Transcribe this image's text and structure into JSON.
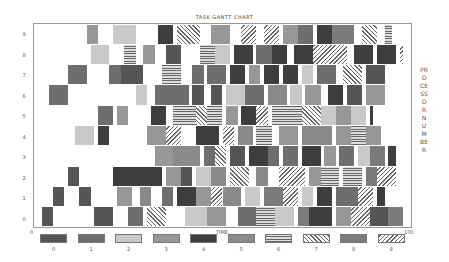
{
  "chart_data": {
    "type": "gantt",
    "title": "TASK GANTT CHART",
    "xlabel": "TIME",
    "ylabel": "PROCESSOR NUMBER",
    "xlim": [
      0,
      100
    ],
    "x_tick_labels": [
      "0",
      "100"
    ],
    "y_tick_labels": [
      "0",
      "1",
      "2",
      "3",
      "4",
      "5",
      "6",
      "7",
      "8",
      "9"
    ],
    "grid": false,
    "legend_position": "bottom",
    "legend": [
      "0",
      "1",
      "2",
      "3",
      "4",
      "5",
      "6",
      "7",
      "8",
      "9"
    ],
    "processors": [
      {
        "id": 0,
        "tasks": [
          {
            "start": 2,
            "end": 5,
            "type": 0
          },
          {
            "start": 16,
            "end": 21,
            "type": 0
          },
          {
            "start": 25,
            "end": 29,
            "type": 1
          },
          {
            "start": 30,
            "end": 35,
            "type": 7
          },
          {
            "start": 40,
            "end": 46,
            "type": 2
          },
          {
            "start": 46,
            "end": 51,
            "type": 3
          },
          {
            "start": 54,
            "end": 59,
            "type": 1
          },
          {
            "start": 59,
            "end": 64,
            "type": 6
          },
          {
            "start": 64,
            "end": 69,
            "type": 2
          },
          {
            "start": 70,
            "end": 73,
            "type": 8
          },
          {
            "start": 73,
            "end": 79,
            "type": 4
          },
          {
            "start": 80,
            "end": 84,
            "type": 3
          },
          {
            "start": 84,
            "end": 89,
            "type": 9
          },
          {
            "start": 89,
            "end": 94,
            "type": 0
          },
          {
            "start": 94,
            "end": 98,
            "type": 8
          }
        ]
      },
      {
        "id": 1,
        "tasks": [
          {
            "start": 5,
            "end": 8,
            "type": 0
          },
          {
            "start": 12,
            "end": 15,
            "type": 0
          },
          {
            "start": 22,
            "end": 26,
            "type": 3
          },
          {
            "start": 28,
            "end": 31,
            "type": 5
          },
          {
            "start": 34,
            "end": 37,
            "type": 1
          },
          {
            "start": 38,
            "end": 43,
            "type": 4
          },
          {
            "start": 43,
            "end": 47,
            "type": 3
          },
          {
            "start": 47,
            "end": 50,
            "type": 9
          },
          {
            "start": 50,
            "end": 55,
            "type": 5
          },
          {
            "start": 56,
            "end": 60,
            "type": 2
          },
          {
            "start": 61,
            "end": 66,
            "type": 8
          },
          {
            "start": 66,
            "end": 70,
            "type": 9
          },
          {
            "start": 71,
            "end": 74,
            "type": 2
          },
          {
            "start": 75,
            "end": 79,
            "type": 4
          },
          {
            "start": 80,
            "end": 86,
            "type": 1
          },
          {
            "start": 86,
            "end": 90,
            "type": 9
          },
          {
            "start": 91,
            "end": 93,
            "type": 4
          }
        ]
      },
      {
        "id": 2,
        "tasks": [
          {
            "start": 9,
            "end": 12,
            "type": 0
          },
          {
            "start": 21,
            "end": 34,
            "type": 4
          },
          {
            "start": 35,
            "end": 39,
            "type": 3
          },
          {
            "start": 39,
            "end": 42,
            "type": 0
          },
          {
            "start": 43,
            "end": 47,
            "type": 2
          },
          {
            "start": 47,
            "end": 51,
            "type": 5
          },
          {
            "start": 52,
            "end": 57,
            "type": 7
          },
          {
            "start": 59,
            "end": 62,
            "type": 5
          },
          {
            "start": 65,
            "end": 72,
            "type": 9
          },
          {
            "start": 73,
            "end": 76,
            "type": 3
          },
          {
            "start": 76,
            "end": 81,
            "type": 6
          },
          {
            "start": 82,
            "end": 87,
            "type": 6
          },
          {
            "start": 88,
            "end": 91,
            "type": 8
          },
          {
            "start": 91,
            "end": 96,
            "type": 9
          }
        ]
      },
      {
        "id": 3,
        "tasks": [
          {
            "start": 32,
            "end": 37,
            "type": 3
          },
          {
            "start": 37,
            "end": 40,
            "type": 5
          },
          {
            "start": 40,
            "end": 44,
            "type": 5
          },
          {
            "start": 45,
            "end": 48,
            "type": 1
          },
          {
            "start": 48,
            "end": 51,
            "type": 7
          },
          {
            "start": 52,
            "end": 56,
            "type": 0
          },
          {
            "start": 57,
            "end": 62,
            "type": 4
          },
          {
            "start": 62,
            "end": 65,
            "type": 1
          },
          {
            "start": 66,
            "end": 70,
            "type": 1
          },
          {
            "start": 71,
            "end": 76,
            "type": 4
          },
          {
            "start": 77,
            "end": 80,
            "type": 3
          },
          {
            "start": 81,
            "end": 85,
            "type": 1
          },
          {
            "start": 86,
            "end": 89,
            "type": 2
          },
          {
            "start": 89,
            "end": 93,
            "type": 8
          },
          {
            "start": 94,
            "end": 96,
            "type": 4
          }
        ]
      },
      {
        "id": 4,
        "tasks": [
          {
            "start": 11,
            "end": 16,
            "type": 2
          },
          {
            "start": 17,
            "end": 20,
            "type": 4
          },
          {
            "start": 30,
            "end": 35,
            "type": 3
          },
          {
            "start": 35,
            "end": 39,
            "type": 9
          },
          {
            "start": 43,
            "end": 49,
            "type": 4
          },
          {
            "start": 50,
            "end": 53,
            "type": 9
          },
          {
            "start": 54,
            "end": 58,
            "type": 5
          },
          {
            "start": 59,
            "end": 63,
            "type": 6
          },
          {
            "start": 65,
            "end": 70,
            "type": 3
          },
          {
            "start": 71,
            "end": 75,
            "type": 5
          },
          {
            "start": 75,
            "end": 79,
            "type": 5
          },
          {
            "start": 80,
            "end": 84,
            "type": 3
          },
          {
            "start": 84,
            "end": 88,
            "type": 6
          },
          {
            "start": 88,
            "end": 92,
            "type": 3
          }
        ]
      },
      {
        "id": 5,
        "tasks": [
          {
            "start": 17,
            "end": 21,
            "type": 1
          },
          {
            "start": 22,
            "end": 25,
            "type": 3
          },
          {
            "start": 31,
            "end": 35,
            "type": 4
          },
          {
            "start": 37,
            "end": 43,
            "type": 6
          },
          {
            "start": 43,
            "end": 46,
            "type": 7
          },
          {
            "start": 46,
            "end": 50,
            "type": 6
          },
          {
            "start": 51,
            "end": 54,
            "type": 3
          },
          {
            "start": 55,
            "end": 59,
            "type": 4
          },
          {
            "start": 59,
            "end": 62,
            "type": 9
          },
          {
            "start": 63,
            "end": 67,
            "type": 6
          },
          {
            "start": 67,
            "end": 71,
            "type": 6
          },
          {
            "start": 71,
            "end": 76,
            "type": 7
          },
          {
            "start": 76,
            "end": 80,
            "type": 2
          },
          {
            "start": 80,
            "end": 84,
            "type": 3
          },
          {
            "start": 84,
            "end": 88,
            "type": 2
          },
          {
            "start": 89,
            "end": 90,
            "type": 4
          }
        ]
      },
      {
        "id": 6,
        "tasks": [
          {
            "start": 4,
            "end": 9,
            "type": 1
          },
          {
            "start": 27,
            "end": 30,
            "type": 2
          },
          {
            "start": 32,
            "end": 41,
            "type": 1
          },
          {
            "start": 42,
            "end": 45,
            "type": 0
          },
          {
            "start": 47,
            "end": 50,
            "type": 0
          },
          {
            "start": 51,
            "end": 56,
            "type": 2
          },
          {
            "start": 56,
            "end": 61,
            "type": 1
          },
          {
            "start": 62,
            "end": 67,
            "type": 5
          },
          {
            "start": 68,
            "end": 71,
            "type": 2
          },
          {
            "start": 72,
            "end": 76,
            "type": 3
          },
          {
            "start": 78,
            "end": 82,
            "type": 4
          },
          {
            "start": 83,
            "end": 87,
            "type": 0
          },
          {
            "start": 88,
            "end": 93,
            "type": 3
          }
        ]
      },
      {
        "id": 7,
        "tasks": [
          {
            "start": 9,
            "end": 14,
            "type": 1
          },
          {
            "start": 20,
            "end": 23,
            "type": 1
          },
          {
            "start": 23,
            "end": 29,
            "type": 0
          },
          {
            "start": 34,
            "end": 39,
            "type": 6
          },
          {
            "start": 42,
            "end": 45,
            "type": 1
          },
          {
            "start": 46,
            "end": 51,
            "type": 1
          },
          {
            "start": 52,
            "end": 56,
            "type": 4
          },
          {
            "start": 57,
            "end": 60,
            "type": 3
          },
          {
            "start": 61,
            "end": 65,
            "type": 4
          },
          {
            "start": 66,
            "end": 70,
            "type": 4
          },
          {
            "start": 71,
            "end": 74,
            "type": 2
          },
          {
            "start": 75,
            "end": 80,
            "type": 1
          },
          {
            "start": 82,
            "end": 87,
            "type": 7
          },
          {
            "start": 88,
            "end": 93,
            "type": 0
          }
        ]
      },
      {
        "id": 8,
        "tasks": [
          {
            "start": 15,
            "end": 20,
            "type": 2
          },
          {
            "start": 24,
            "end": 27,
            "type": 6
          },
          {
            "start": 29,
            "end": 32,
            "type": 3
          },
          {
            "start": 35,
            "end": 39,
            "type": 0
          },
          {
            "start": 44,
            "end": 48,
            "type": 6
          },
          {
            "start": 48,
            "end": 52,
            "type": 2
          },
          {
            "start": 53,
            "end": 58,
            "type": 4
          },
          {
            "start": 59,
            "end": 63,
            "type": 1
          },
          {
            "start": 63,
            "end": 67,
            "type": 4
          },
          {
            "start": 69,
            "end": 74,
            "type": 4
          },
          {
            "start": 74,
            "end": 83,
            "type": 9
          },
          {
            "start": 85,
            "end": 90,
            "type": 4
          },
          {
            "start": 91,
            "end": 96,
            "type": 4
          },
          {
            "start": 97,
            "end": 98,
            "type": 9
          }
        ]
      },
      {
        "id": 9,
        "tasks": [
          {
            "start": 14,
            "end": 17,
            "type": 3
          },
          {
            "start": 21,
            "end": 27,
            "type": 2
          },
          {
            "start": 33,
            "end": 37,
            "type": 4
          },
          {
            "start": 38,
            "end": 44,
            "type": 7
          },
          {
            "start": 47,
            "end": 52,
            "type": 3
          },
          {
            "start": 55,
            "end": 59,
            "type": 9
          },
          {
            "start": 61,
            "end": 65,
            "type": 9
          },
          {
            "start": 66,
            "end": 70,
            "type": 3
          },
          {
            "start": 70,
            "end": 74,
            "type": 1
          },
          {
            "start": 75,
            "end": 79,
            "type": 4
          },
          {
            "start": 79,
            "end": 85,
            "type": 8
          },
          {
            "start": 87,
            "end": 91,
            "type": 7
          },
          {
            "start": 93,
            "end": 95,
            "type": 6
          }
        ]
      }
    ]
  }
}
